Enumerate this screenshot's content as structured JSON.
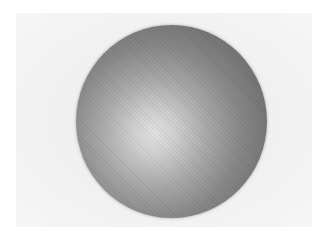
{
  "image": {
    "subject": "shaded sphere",
    "style": "grayscale halftone print",
    "colors": {
      "background": "#f2f2f2",
      "sphere_edge": "#6a6a6a",
      "sphere_highlight": "#e2e2e2"
    }
  }
}
